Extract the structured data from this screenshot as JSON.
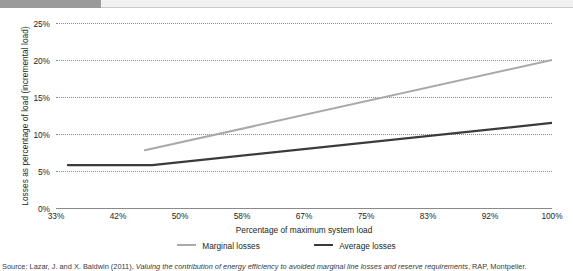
{
  "header": {
    "band_title": ""
  },
  "chart_data": {
    "type": "line",
    "title": "",
    "xlabel": "Percentage of maximum system load",
    "ylabel": "Losses as percentage of load (incremental load)",
    "xlim": [
      33,
      100
    ],
    "ylim": [
      0,
      25
    ],
    "grid": true,
    "legend_position": "bottom",
    "x_tick_labels": [
      "33%",
      "42%",
      "50%",
      "58%",
      "67%",
      "75%",
      "83%",
      "92%",
      "100%"
    ],
    "x_ticks": [
      33,
      42,
      50,
      58,
      67,
      75,
      83,
      92,
      100
    ],
    "y_tick_labels": [
      "0%",
      "5%",
      "10%",
      "15%",
      "20%",
      "25%"
    ],
    "y_ticks": [
      0,
      5,
      10,
      15,
      20,
      25
    ],
    "series": [
      {
        "name": "Marginal losses",
        "color": "#a7a9ac",
        "width": 2.0,
        "x": [
          45,
          100
        ],
        "values": [
          7.8,
          20.0
        ]
      },
      {
        "name": "Average losses",
        "color": "#3b3b3b",
        "width": 2.2,
        "x": [
          34.6,
          46,
          100
        ],
        "values": [
          5.8,
          5.8,
          11.5
        ]
      }
    ]
  },
  "legend": {
    "items": [
      {
        "label": "Marginal losses"
      },
      {
        "label": "Average losses"
      }
    ]
  },
  "source": {
    "prefix": "Source: Lazar, J. and X. Baldwin (2011), ",
    "italic_title": "Valuing the contribution of energy efficiency to avoided marginal line losses and reserve requirements",
    "suffix": ", RAP, Montpelier."
  }
}
